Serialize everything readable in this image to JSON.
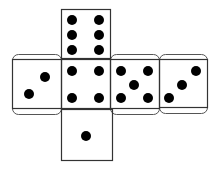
{
  "diagram": {
    "type": "dice-net",
    "colors": {
      "background": "#ffffff",
      "stroke": "#333333",
      "tab_stroke": "#555555",
      "pip": "#000000"
    },
    "faces": [
      {
        "id": "top",
        "value": 6,
        "x": 61,
        "y": 9,
        "size": 49,
        "pips": [
          [
            72,
            20
          ],
          [
            99,
            20
          ],
          [
            72,
            35
          ],
          [
            99,
            35
          ],
          [
            72,
            50
          ],
          [
            99,
            50
          ]
        ]
      },
      {
        "id": "left",
        "value": 2,
        "x": 12,
        "y": 59,
        "size": 49,
        "tab": true,
        "pips": [
          [
            29,
            94
          ],
          [
            45,
            77
          ]
        ]
      },
      {
        "id": "center",
        "value": 4,
        "x": 61,
        "y": 59,
        "size": 49,
        "pips": [
          [
            72,
            71
          ],
          [
            99,
            71
          ],
          [
            72,
            98
          ],
          [
            99,
            98
          ]
        ]
      },
      {
        "id": "right1",
        "value": 5,
        "x": 110,
        "y": 59,
        "size": 49,
        "tab": true,
        "pips": [
          [
            121,
            71
          ],
          [
            148,
            71
          ],
          [
            134,
            85
          ],
          [
            121,
            98
          ],
          [
            148,
            98
          ]
        ]
      },
      {
        "id": "right2",
        "value": 3,
        "x": 159,
        "y": 59,
        "size": 48,
        "tab": true,
        "pips": [
          [
            169,
            98
          ],
          [
            182,
            85
          ],
          [
            196,
            71
          ]
        ]
      },
      {
        "id": "bottom",
        "value": 1,
        "x": 61,
        "y": 109,
        "size": 51,
        "pips": [
          [
            86,
            136
          ]
        ]
      }
    ],
    "pip_radius": 5
  }
}
